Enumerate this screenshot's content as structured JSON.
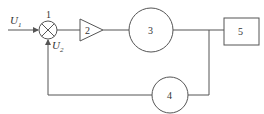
{
  "diagram": {
    "type": "block-diagram",
    "colors": {
      "line": "#555555",
      "text": "#333333",
      "background": "#ffffff"
    },
    "signals": {
      "input": {
        "symbol": "U",
        "subscript": "1"
      },
      "feedback": {
        "symbol": "U",
        "subscript": "2"
      }
    },
    "blocks": [
      {
        "id": "1",
        "label": "1",
        "shape": "summing-junction"
      },
      {
        "id": "2",
        "label": "2",
        "shape": "triangle-amplifier"
      },
      {
        "id": "3",
        "label": "3",
        "shape": "circle"
      },
      {
        "id": "4",
        "label": "4",
        "shape": "circle"
      },
      {
        "id": "5",
        "label": "5",
        "shape": "rectangle"
      }
    ],
    "connections": [
      {
        "from": "U1",
        "to": "1"
      },
      {
        "from": "1",
        "to": "2"
      },
      {
        "from": "2",
        "to": "3"
      },
      {
        "from": "3",
        "to": "5"
      },
      {
        "from": "3",
        "to": "4",
        "note": "branch / feedback"
      },
      {
        "from": "4",
        "to": "1",
        "signal": "U2"
      }
    ]
  }
}
